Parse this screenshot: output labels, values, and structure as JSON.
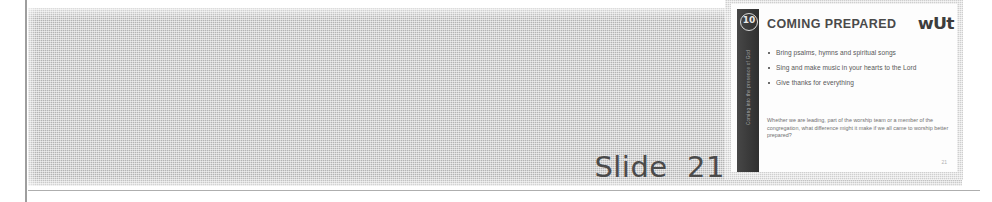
{
  "page": {
    "background_color": "#ffffff",
    "width": 992,
    "height": 202
  },
  "scan": {
    "halftone_band_color": "#b3b3b3",
    "margin_rule_color": "#8d8d8d"
  },
  "caption": {
    "text": "Slide  21",
    "color": "#4b4b4b"
  },
  "slide": {
    "badge_number": "10",
    "sidebar_vertical_text": "Coming into the presence of God",
    "title": "COMING PREPARED",
    "logo_text": "wUt",
    "bullets": [
      "Bring psalms, hymns and spiritual songs",
      "Sing and make music in your hearts to the Lord",
      "Give thanks for everything"
    ],
    "paragraph": "Whether we are leading, part of the worship team or a member of the congregation, what difference might it make if we all came to worship better prepared?",
    "slide_number": "21",
    "sidebar_color": "#3a3a3a",
    "canvas_color": "#fdfdfd"
  }
}
